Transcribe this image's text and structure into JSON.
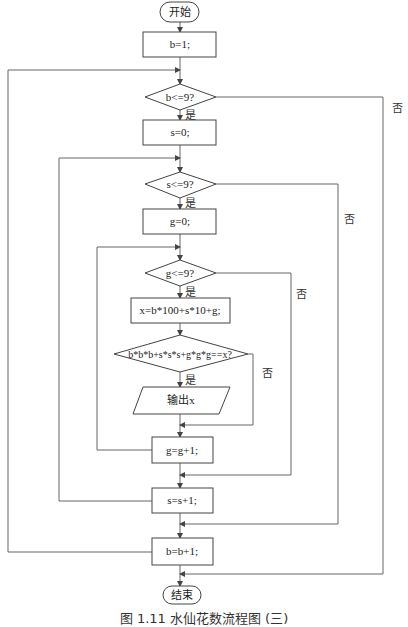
{
  "diagram": {
    "type": "flowchart",
    "title_caption": "图 1.11  水仙花数流程图 (三)",
    "nodes": {
      "start": "开始",
      "init_b": "b=1;",
      "cond_b": "b<=9?",
      "init_s": "s=0;",
      "cond_s": "s<=9?",
      "init_g": "g=0;",
      "cond_g": "g<=9?",
      "calc_x": "x=b*100+s*10+g;",
      "cond_narc": "b*b*b+s*s*s+g*g*g==x?",
      "output": "输出x",
      "inc_g": "g=g+1;",
      "inc_s": "s=s+1;",
      "inc_b": "b=b+1;",
      "end": "结束"
    },
    "edge_labels": {
      "yes": "是",
      "no": "否"
    }
  }
}
